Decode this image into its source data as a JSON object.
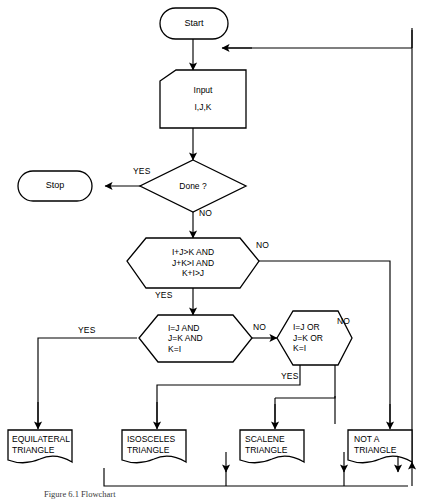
{
  "diagram": {
    "caption": "Figure 6.1   Flowchart"
  },
  "nodes": {
    "start": {
      "label": "Start",
      "shape": "terminator"
    },
    "input": {
      "line1": "Input",
      "line2": "I,J,K",
      "shape": "manual-input"
    },
    "done": {
      "label": "Done ?",
      "shape": "diamond"
    },
    "stop": {
      "label": "Stop",
      "shape": "terminator"
    },
    "inequality": {
      "line1": "I+J>K AND",
      "line2": "J+K>I AND",
      "line3": "K+I>J",
      "shape": "hexagon"
    },
    "equilateral_test": {
      "line1": "I=J AND",
      "line2": "J=K AND",
      "line3": "K=I",
      "shape": "hexagon"
    },
    "isosceles_test": {
      "line1": "I=J OR",
      "line2": "J=K OR",
      "line3": "K=I",
      "shape": "hexagon"
    },
    "equilateral_out": {
      "line1": "EQUILATERAL",
      "line2": "TRIANGLE",
      "shape": "document"
    },
    "isosceles_out": {
      "line1": "ISOSCELES",
      "line2": "TRIANGLE",
      "shape": "document"
    },
    "scalene_out": {
      "line1": "SCALENE",
      "line2": "TRIANGLE",
      "shape": "document"
    },
    "not_triangle_out": {
      "line1": "NOT A",
      "line2": "TRIANGLE",
      "shape": "document"
    }
  },
  "edge_labels": {
    "done_yes": "YES",
    "done_no": "NO",
    "inequality_no": "NO",
    "inequality_yes": "YES",
    "equilateral_yes": "YES",
    "equilateral_no": "NO",
    "isosceles_no": "NO",
    "isosceles_yes": "YES"
  },
  "colors": {
    "stroke": "#000000",
    "fill": "#ffffff",
    "background": "#ffffff"
  }
}
